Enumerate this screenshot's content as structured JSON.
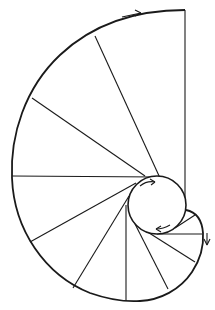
{
  "diagram": {
    "colors": {
      "stroke": "#1a1a1a",
      "background": "#ffffff"
    },
    "base_circle": {
      "cx": 157,
      "cy": 205,
      "r": 29
    },
    "involute_path": "M185,10 C140,10 95,22 60,55 C25,88 10,135 12,178 C14,230 45,275 90,293 C110,300 125,302 140,301 C160,300 180,290 192,272 C200,260 204,248 203,233 C202,220 196,212 186,210",
    "tangent_lines": [
      {
        "x1": 185,
        "y1": 10,
        "x2": 185,
        "y2": 200
      },
      {
        "x1": 95,
        "y1": 36,
        "x2": 160,
        "y2": 178
      },
      {
        "x1": 32,
        "y1": 98,
        "x2": 145,
        "y2": 176
      },
      {
        "x1": 12,
        "y1": 176,
        "x2": 158,
        "y2": 177
      },
      {
        "x1": 30,
        "y1": 242,
        "x2": 136,
        "y2": 183
      },
      {
        "x1": 73,
        "y1": 288,
        "x2": 129,
        "y2": 196
      },
      {
        "x1": 126,
        "y1": 301,
        "x2": 126,
        "y2": 205
      },
      {
        "x1": 168,
        "y1": 289,
        "x2": 133,
        "y2": 220
      },
      {
        "x1": 195,
        "y1": 262,
        "x2": 146,
        "y2": 231
      },
      {
        "x1": 202,
        "y1": 234,
        "x2": 157,
        "y2": 234
      },
      {
        "x1": 195,
        "y1": 215,
        "x2": 175,
        "y2": 228
      }
    ],
    "arrows": [
      {
        "name": "top-arrow",
        "path": "M122,17 L141,13",
        "head": "M141,13 L135,10 M141,13 L135,16"
      },
      {
        "name": "circle-top-arrow",
        "path": "M140,186 C145,182 150,181 155,182",
        "head": "M155,182 L150,179 M155,182 L151,185"
      },
      {
        "name": "circle-bottom-arrow",
        "path": "M170,225 C165,228 160,229 156,229",
        "head": "M156,229 L161,226 M156,229 L161,232"
      },
      {
        "name": "right-arrow",
        "path": "M207,233 L207,245",
        "head": "M207,245 L204,239 M207,245 L210,239"
      }
    ]
  }
}
